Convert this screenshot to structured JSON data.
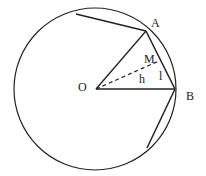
{
  "diagram": {
    "type": "geometry",
    "stroke_color": "#222222",
    "circle": {
      "cx": 95,
      "cy": 89,
      "r": 81
    },
    "points": {
      "O": {
        "x": 96,
        "y": 89
      },
      "A": {
        "x": 146,
        "y": 31
      },
      "B": {
        "x": 175,
        "y": 89
      },
      "M": {
        "x": 161,
        "y": 60
      },
      "P1": {
        "x": 76,
        "y": 14
      },
      "P2": {
        "x": 147,
        "y": 148
      }
    },
    "labels": {
      "A": "A",
      "B": "B",
      "O": "O",
      "M": "M",
      "h": "h",
      "l": "l"
    }
  }
}
